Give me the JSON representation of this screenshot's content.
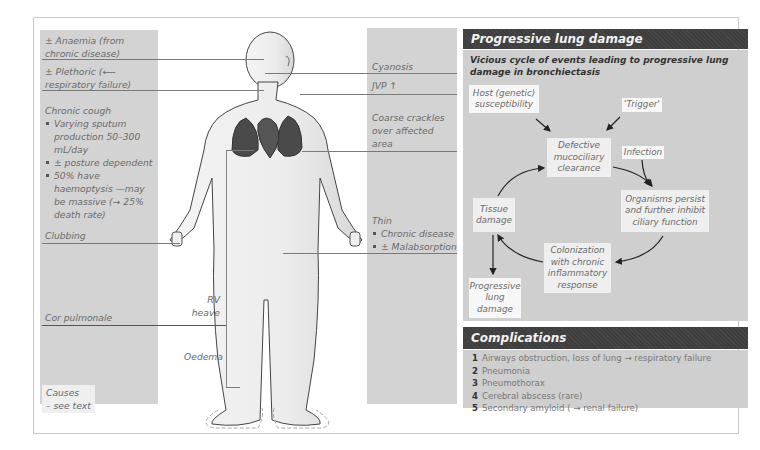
{
  "left_labels": {
    "anaemia": [
      "± Anaemia (from",
      "chronic disease)"
    ],
    "plethoric": [
      "± Plethoric (⟵",
      "respiratory failure)"
    ],
    "cough_title": "Chronic cough",
    "cough_items": [
      "Varying sputum production 50–300 mL/day",
      "± posture dependent",
      "50% have haemoptysis —may be massive (→ 25% death rate)"
    ],
    "clubbing": "Clubbing",
    "cor_pulmonale": "Cor pulmonale",
    "rv_heave": [
      "RV",
      "heave"
    ],
    "oedema": "Oedema",
    "causes": [
      "Causes",
      "– see text"
    ]
  },
  "right_labels": {
    "cyanosis": "Cyanosis",
    "jvp": "JVP ↑",
    "crackles": [
      "Coarse crackles",
      "over affected",
      "area"
    ],
    "thin_title": "Thin",
    "thin_items": [
      "Chronic disease",
      "± Malabsorption"
    ]
  },
  "lung_panel": {
    "title": "Progressive lung damage",
    "subtitle": [
      "Vicious cycle of events leading to progressive lung",
      "damage in bronchiectasis"
    ],
    "nodes": {
      "host": "Host (genetic) susceptibility",
      "trigger": "'Trigger'",
      "defective": "Defective mucociliary clearance",
      "infection": "Infection",
      "organisms": "Organisms persist and further inhibit ciliary function",
      "colonization": "Colonization with chronic inflammatory response",
      "tissue": "Tissue damage",
      "progressive": "Progressive lung damage"
    }
  },
  "complications": {
    "title": "Complications",
    "items": [
      {
        "num": "1",
        "text": "Airways obstruction, loss of lung → respiratory failure"
      },
      {
        "num": "2",
        "text": "Pneumonia"
      },
      {
        "num": "3",
        "text": "Pneumothorax"
      },
      {
        "num": "4",
        "text": "Cerebral abscess (rare)"
      },
      {
        "num": "5",
        "text": "Secondary amyloid ( → renal failure)"
      }
    ]
  },
  "colors": {
    "header_bg": "#3e3e3e",
    "panel_bg": "#cfcfcf",
    "label_column_bg": "#d3d3d3",
    "lung_fill": "#4a4a4a"
  }
}
